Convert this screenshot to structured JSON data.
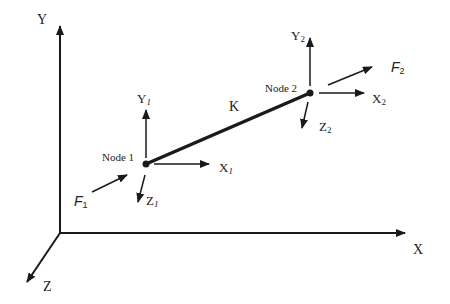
{
  "diagram": {
    "global_axes": {
      "x_label": "X",
      "y_label": "Y",
      "z_label": "Z"
    },
    "element_label": "K",
    "node1": {
      "label": "Node 1",
      "x_label": "X",
      "x_sub": "1",
      "y_label": "Y",
      "y_sub": "1",
      "z_label": "Z",
      "z_sub": "1",
      "force_label": "F",
      "force_sub": "1"
    },
    "node2": {
      "label": "Node 2",
      "x_label": "X",
      "x_sub": "2",
      "y_label": "Y",
      "y_sub": "2",
      "z_label": "Z",
      "z_sub": "2",
      "force_label": "F",
      "force_sub": "2"
    },
    "colors": {
      "line": "#1a1a1a",
      "text": "#222222",
      "background": "#ffffff"
    }
  }
}
